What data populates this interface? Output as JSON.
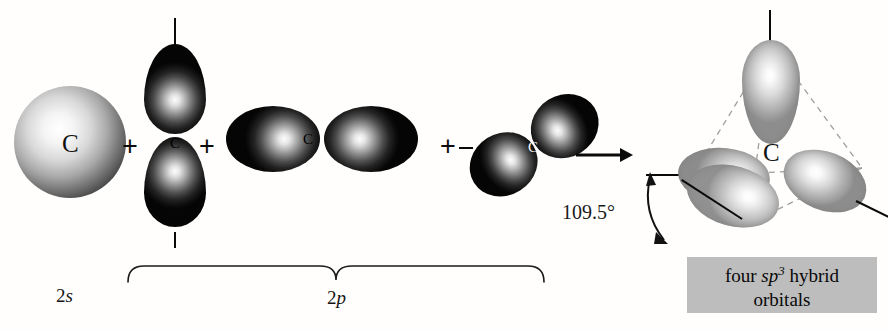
{
  "figure": {
    "background_color": "#fffefc",
    "caption_box_color": "#bdbdbd",
    "orbital_dark_color": "#0d0d0d",
    "orbital_light_color": "#c6c6c6",
    "dashed_line_color": "#9a9a9a"
  },
  "reactants": {
    "s_orbital": {
      "atom_label": "C",
      "sublabel_prefix": "2",
      "sublabel_suffix": "s",
      "shape": "sphere"
    },
    "p_orbitals": {
      "group_sublabel_prefix": "2",
      "group_sublabel_suffix": "p",
      "items": [
        {
          "atom_label": "C",
          "orientation": "vertical"
        },
        {
          "atom_label": "C",
          "orientation": "horizontal"
        },
        {
          "atom_label": "C",
          "orientation": "diagonal"
        }
      ]
    },
    "plus_signs": [
      "+",
      "+",
      "+"
    ]
  },
  "arrow": {
    "symbol": "→",
    "direction": "right"
  },
  "product": {
    "atom_label": "C",
    "angle_label": "109.5°",
    "lobe_count": 4,
    "caption": {
      "line1_pre": "four ",
      "line1_italic": "sp",
      "line1_sup": "3",
      "line1_post": " hybrid",
      "line2": "orbitals"
    }
  }
}
